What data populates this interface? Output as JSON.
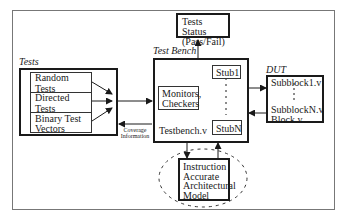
{
  "diagram": {
    "groups": {
      "tests": {
        "label": "Tests",
        "items": [
          "Random Tests",
          "Directed Tests",
          "Binary Test\nVectors"
        ]
      },
      "test_bench": {
        "label": "Test Bench",
        "monitors": "Monitors,\nCheckers",
        "file": "Testbench.v",
        "stub_first": "Stub1",
        "stub_last": "StubN"
      },
      "dut": {
        "label": "DUT",
        "sub_first": "Subblock1.v",
        "sub_last": "SubblockN.v",
        "top": "Block.v"
      },
      "status": {
        "label": "Tests Status\n(Pass/Fail)"
      },
      "model": {
        "label": "Instruction\nAccurate\nArchitectural\nModel"
      }
    },
    "annotations": {
      "coverage": "Coverage\nInformation"
    },
    "edges": [
      {
        "from": "Random Tests",
        "to": "Test Bench input"
      },
      {
        "from": "Directed Tests",
        "to": "Test Bench input"
      },
      {
        "from": "Binary Test Vectors",
        "to": "Test Bench input"
      },
      {
        "from": "Tests",
        "to": "Test Bench"
      },
      {
        "from": "Test Bench",
        "to": "Tests",
        "label": "Coverage Information"
      },
      {
        "from": "Test Bench",
        "to": "Tests Status (Pass/Fail)"
      },
      {
        "from": "Test Bench",
        "to": "DUT"
      },
      {
        "from": "DUT",
        "to": "Test Bench"
      },
      {
        "from": "Test Bench",
        "to": "Instruction Accurate Architectural Model"
      },
      {
        "from": "Instruction Accurate Architectural Model",
        "to": "StubN"
      }
    ]
  }
}
